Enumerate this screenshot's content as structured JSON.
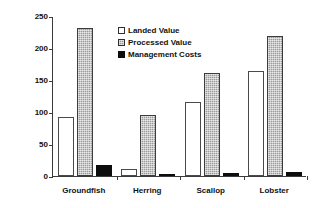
{
  "chart_data": {
    "type": "bar",
    "title": "",
    "xlabel": "",
    "ylabel": "10^6 $Can",
    "ylabel_prefix": "10",
    "ylabel_exponent": "6",
    "ylabel_suffix": " $Can",
    "categories": [
      "Groundfish",
      "Herring",
      "Scallop",
      "Lobster"
    ],
    "series": [
      {
        "name": "Landed Value",
        "values": [
          92,
          11,
          115,
          164
        ],
        "style": "open-white",
        "color": "#ffffff"
      },
      {
        "name": "Processed Value",
        "values": [
          231,
          96,
          161,
          219
        ],
        "style": "gray-hatch",
        "color": "#9a9a9a"
      },
      {
        "name": "Management Costs",
        "values": [
          17,
          1,
          4,
          7
        ],
        "style": "solid-black",
        "color": "#0d0d0d"
      }
    ],
    "ylim": [
      0,
      250
    ],
    "yticks": [
      250,
      200,
      150,
      100,
      50,
      0
    ],
    "ytick_labels": [
      "250",
      "200",
      "150",
      "100",
      "50",
      "0"
    ],
    "grid": false,
    "legend_position": "upper-center"
  }
}
